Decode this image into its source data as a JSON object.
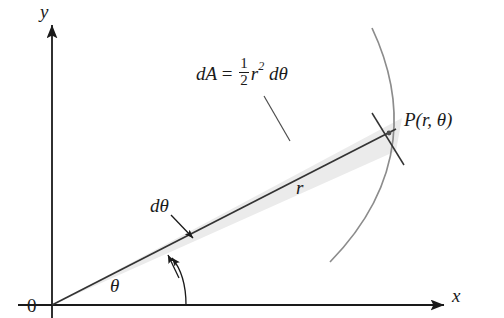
{
  "figure": {
    "type": "polar-area-element-diagram",
    "axes": {
      "y_label": "y",
      "x_label": "x",
      "origin_label": "0"
    },
    "labels": {
      "radius": "r",
      "d_theta": "dθ",
      "theta": "θ",
      "point": "P(r, θ)"
    },
    "area_formula": {
      "lhs": "dA",
      "equals": "=",
      "numerator": "1",
      "denominator": "2",
      "radius_symbol": "r",
      "exponent": "2",
      "differential": "dθ"
    },
    "colors": {
      "ink": "#1a1a1a",
      "curve": "#8c8c8c",
      "wedge_fill": "#ebebeb",
      "background": "#ffffff"
    }
  }
}
